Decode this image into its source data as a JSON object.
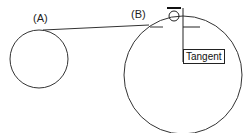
{
  "diagram": {
    "labels": {
      "point_a": "(A)",
      "point_b": "(B)",
      "tooltip": "Tangent"
    },
    "colors": {
      "stroke": "#333333",
      "background": "#ffffff"
    }
  }
}
